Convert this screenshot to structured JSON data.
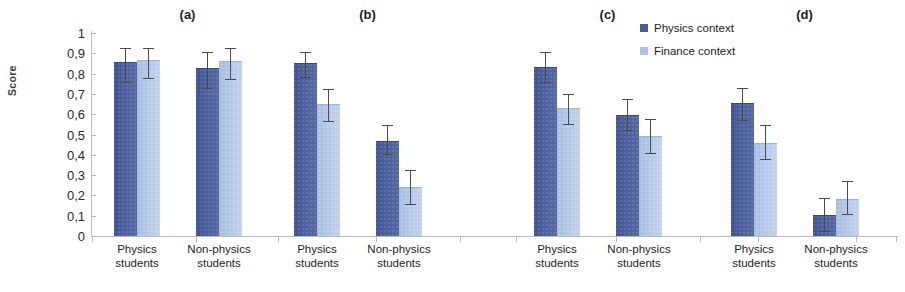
{
  "chart_data": {
    "type": "bar",
    "title": "",
    "xlabel": "",
    "ylabel": "Score",
    "ylim": [
      0,
      1
    ],
    "ytick_labels": [
      "1",
      "0,9",
      "0,8",
      "0,7",
      "0,6",
      "0,5",
      "0,4",
      "0,3",
      "0,2",
      "0,1",
      "0"
    ],
    "ytick_values": [
      1,
      0.9,
      0.8,
      0.7,
      0.6,
      0.5,
      0.4,
      0.3,
      0.2,
      0.1,
      0
    ],
    "grid": false,
    "legend_position": "top-right",
    "categories": [
      "Physics students",
      "Non-physics students"
    ],
    "series_names": [
      "Physics context",
      "Finance context"
    ],
    "panels": [
      {
        "label": "(a)",
        "groups": [
          {
            "category": "Physics students",
            "bars": [
              {
                "series": "Physics context",
                "value": 0.85,
                "err_low": 0.755,
                "err_high": 0.925
              },
              {
                "series": "Finance context",
                "value": 0.86,
                "err_low": 0.775,
                "err_high": 0.925
              }
            ]
          },
          {
            "category": "Non-physics students",
            "bars": [
              {
                "series": "Physics context",
                "value": 0.825,
                "err_low": 0.725,
                "err_high": 0.905
              },
              {
                "series": "Finance context",
                "value": 0.855,
                "err_low": 0.77,
                "err_high": 0.925
              }
            ]
          }
        ]
      },
      {
        "label": "(b)",
        "groups": [
          {
            "category": "Physics students",
            "bars": [
              {
                "series": "Physics context",
                "value": 0.845,
                "err_low": 0.78,
                "err_high": 0.905
              },
              {
                "series": "Finance context",
                "value": 0.645,
                "err_low": 0.56,
                "err_high": 0.725
              }
            ]
          },
          {
            "category": "Non-physics students",
            "bars": [
              {
                "series": "Physics context",
                "value": 0.465,
                "err_low": 0.4,
                "err_high": 0.545
              },
              {
                "series": "Finance context",
                "value": 0.235,
                "err_low": 0.155,
                "err_high": 0.325
              }
            ]
          }
        ]
      },
      {
        "label": "(c)",
        "groups": [
          {
            "category": "Physics students",
            "bars": [
              {
                "series": "Physics context",
                "value": 0.83,
                "err_low": 0.755,
                "err_high": 0.905
              },
              {
                "series": "Finance context",
                "value": 0.625,
                "err_low": 0.545,
                "err_high": 0.7
              }
            ]
          },
          {
            "category": "Non-physics students",
            "bars": [
              {
                "series": "Physics context",
                "value": 0.59,
                "err_low": 0.515,
                "err_high": 0.675
              },
              {
                "series": "Finance context",
                "value": 0.49,
                "err_low": 0.405,
                "err_high": 0.575
              }
            ]
          }
        ]
      },
      {
        "label": "(d)",
        "groups": [
          {
            "category": "Physics students",
            "bars": [
              {
                "series": "Physics context",
                "value": 0.65,
                "err_low": 0.565,
                "err_high": 0.73
              },
              {
                "series": "Finance context",
                "value": 0.455,
                "err_low": 0.375,
                "err_high": 0.545
              }
            ]
          },
          {
            "category": "Non-physics students",
            "bars": [
              {
                "series": "Physics context",
                "value": 0.1,
                "err_low": 0.02,
                "err_high": 0.185
              },
              {
                "series": "Finance context",
                "value": 0.175,
                "err_low": 0.105,
                "err_high": 0.27
              }
            ]
          }
        ]
      }
    ],
    "colors": {
      "physics_context": "#4a5c96",
      "finance_context": "#aec3e4",
      "error_bar": "#4a4a4a",
      "axis": "#b9b9b9"
    }
  },
  "legend": {
    "items": [
      {
        "label": "Physics context"
      },
      {
        "label": "Finance context"
      }
    ]
  }
}
